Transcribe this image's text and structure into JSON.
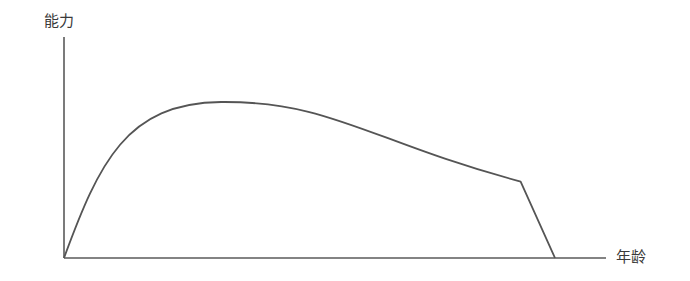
{
  "chart_data": {
    "type": "line",
    "title": "",
    "xlabel": "年龄",
    "ylabel": "能力",
    "grid": false,
    "legend": null,
    "ticks": {
      "x": [],
      "y": []
    },
    "x": [
      0,
      0.05,
      0.1,
      0.15,
      0.2,
      0.25,
      0.3,
      0.32,
      0.35,
      0.4,
      0.5,
      0.6,
      0.7,
      0.8,
      0.9,
      0.93,
      1.0
    ],
    "series": [
      {
        "name": "能力",
        "values": [
          0,
          0.36,
          0.6,
          0.78,
          0.9,
          0.97,
          1.0,
          1.0,
          0.995,
          0.98,
          0.92,
          0.84,
          0.75,
          0.64,
          0.53,
          0.49,
          0
        ],
        "color": "#555555"
      }
    ],
    "key_points": {
      "origin": [
        0,
        0
      ],
      "peak": [
        0.32,
        1.0
      ],
      "decline_kink": [
        0.93,
        0.49
      ],
      "end": [
        1.0,
        0
      ]
    },
    "xlim": [
      0,
      1.1
    ],
    "ylim": [
      0,
      1.4
    ]
  },
  "axes": {
    "y_label": "能力",
    "x_label": "年龄",
    "color": "#555555"
  }
}
